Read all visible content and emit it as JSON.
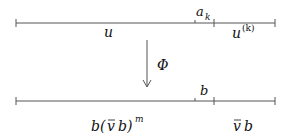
{
  "diagram": {
    "top_segment": {
      "label_main": "u",
      "label_marker": "a",
      "label_marker_sub": "k",
      "label_right": "u",
      "label_right_sup": "(k)"
    },
    "map": {
      "label": "Φ"
    },
    "bottom_segment": {
      "label_main_b": "b(",
      "label_main_vbar": "v",
      "label_main_rest": "b)",
      "label_main_sup": "m",
      "label_marker": "b",
      "label_right_vbar": "v",
      "label_right_b": "b"
    },
    "colors": {
      "line": "#555555",
      "text": "#111111"
    }
  }
}
